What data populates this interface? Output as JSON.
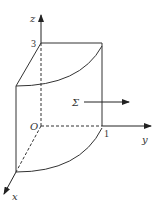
{
  "figure": {
    "type": "3d-surface-diagram",
    "axes": {
      "x_label": "x",
      "y_label": "y",
      "z_label": "z",
      "origin_label": "O"
    },
    "tick_labels": {
      "z_height": "3",
      "y_radius": "1"
    },
    "surface_label": "Σ",
    "colors": {
      "stroke": "#333333",
      "background": "#ffffff"
    }
  }
}
